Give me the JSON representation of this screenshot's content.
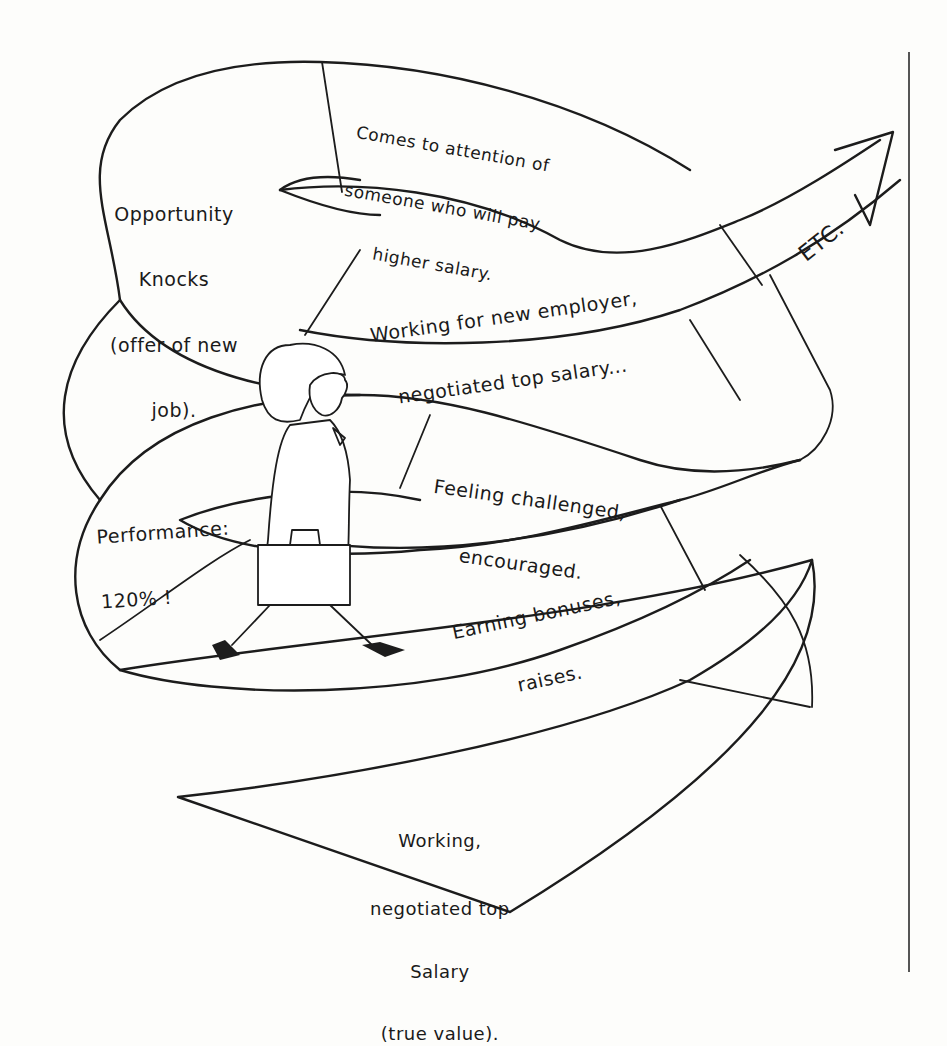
{
  "diagram": {
    "type": "spiral-career-path",
    "segments": [
      {
        "id": "working-true-value",
        "lines": [
          "Working,",
          "negotiated top",
          "Salary",
          "(true value)."
        ]
      },
      {
        "id": "earning-bonuses",
        "lines": [
          "Earning bonuses,",
          "raises."
        ]
      },
      {
        "id": "feeling-challenged",
        "lines": [
          "Feeling challenged,",
          "encouraged."
        ]
      },
      {
        "id": "performance",
        "lines": [
          "Performance:",
          "120% !"
        ]
      },
      {
        "id": "opportunity-knocks",
        "lines": [
          "Opportunity",
          "Knocks",
          "(offer of new",
          "job)."
        ]
      },
      {
        "id": "comes-to-attention",
        "lines": [
          "Comes to attention of",
          "someone who will pay",
          "higher salary."
        ]
      },
      {
        "id": "working-new-employer",
        "lines": [
          "Working for new employer,",
          "negotiated top salary..."
        ]
      },
      {
        "id": "etc",
        "lines": [
          "ETC."
        ]
      }
    ],
    "figure": "woman-walking-with-briefcase",
    "ink_color": "#1c1c1c",
    "paper_color": "#fdfdfb"
  }
}
